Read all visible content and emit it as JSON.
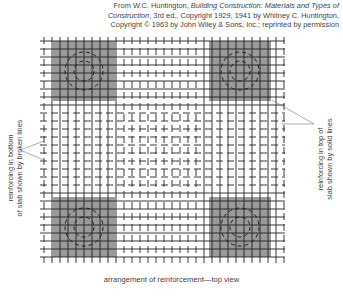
{
  "credit": {
    "line1_prefix": "From W.C. Huntington, ",
    "line1_italic": "Building Construction: Materials and Types of",
    "line2_italic": "Construction",
    "line2_rest": ", 3rd ed., Copyright 1929, 1941 by Whitney C. Huntington,",
    "line3": "Copyright © 1963 by John Wiley & Sons, Inc.; reprinted by permission"
  },
  "labels": {
    "left_line1": "reinforcing in bottom",
    "left_line2": "of slab shown by broken lines",
    "right_line1": "reinforcing in top of",
    "right_line2": "slab shown by solid lines"
  },
  "caption": "arrangement of reinforcement—top view",
  "diagram": {
    "grid": {
      "x0": 40,
      "x1": 285,
      "y0": 37,
      "y1": 263,
      "spacing": 8
    },
    "column_panels": [
      {
        "name": "top-left",
        "x": 53,
        "y": 41,
        "w": 62,
        "h": 60
      },
      {
        "name": "top-right",
        "x": 209,
        "y": 41,
        "w": 62,
        "h": 60
      },
      {
        "name": "bottom-left",
        "x": 53,
        "y": 197,
        "w": 62,
        "h": 60
      },
      {
        "name": "bottom-right",
        "x": 209,
        "y": 197,
        "w": 62,
        "h": 60
      }
    ],
    "colors": {
      "panel": "#9a9a9a",
      "bar": "#222222",
      "leader": "#777777"
    }
  }
}
